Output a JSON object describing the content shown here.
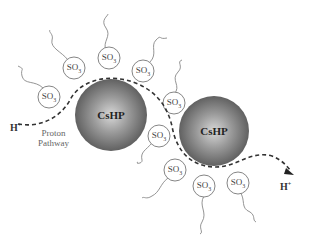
{
  "diagram": {
    "particles": [
      {
        "label": "CsHP",
        "cx": 111,
        "cy": 115,
        "r": 36
      },
      {
        "label": "CsHP",
        "cx": 214,
        "cy": 131,
        "r": 35
      }
    ],
    "sulfonate_groups": [
      {
        "label": "SO",
        "sub": "3",
        "x": 49,
        "y": 97
      },
      {
        "label": "SO",
        "sub": "3",
        "x": 74,
        "y": 68
      },
      {
        "label": "SO",
        "sub": "3",
        "x": 109,
        "y": 58
      },
      {
        "label": "SO",
        "sub": "3",
        "x": 143,
        "y": 71
      },
      {
        "label": "SO",
        "sub": "3",
        "x": 174,
        "y": 103
      },
      {
        "label": "SO",
        "sub": "3",
        "x": 159,
        "y": 136
      },
      {
        "label": "SO",
        "sub": "3",
        "x": 175,
        "y": 170
      },
      {
        "label": "SO",
        "sub": "3",
        "x": 204,
        "y": 186
      },
      {
        "label": "SO",
        "sub": "3",
        "x": 238,
        "y": 183
      }
    ],
    "proton_in": {
      "label": "H",
      "sup": "+"
    },
    "proton_out": {
      "label": "H",
      "sup": "+"
    },
    "pathway_label_line1": "Proton",
    "pathway_label_line2": "Pathway"
  }
}
